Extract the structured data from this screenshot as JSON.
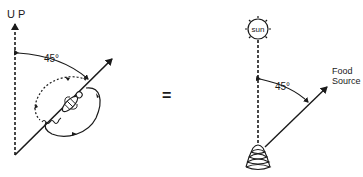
{
  "diagram": {
    "type": "bee-waggle-dance-equivalence",
    "left_panel": {
      "up_label": "U P",
      "angle_label": "45°"
    },
    "equals_sign": "=",
    "right_panel": {
      "sun_label": "sun",
      "angle_label": "45°",
      "food_source_line1": "Food",
      "food_source_line2": "Source"
    }
  },
  "colors": {
    "ink": "#1a1a1a",
    "background": "#ffffff"
  }
}
